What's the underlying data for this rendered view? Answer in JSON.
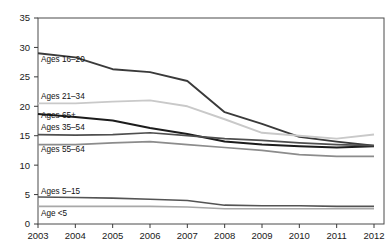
{
  "title_partial": "",
  "chart_data": {
    "type": "line",
    "title": "",
    "subtitle": "",
    "xlabel": "",
    "ylabel": "",
    "x": [
      "2003",
      "2004",
      "2005",
      "2006",
      "2007",
      "2008",
      "2009",
      "2010",
      "2011",
      "2012"
    ],
    "xlim": [
      2003,
      2012
    ],
    "ylim": [
      0,
      35
    ],
    "yticks": [
      "0",
      "5",
      "10",
      "15",
      "20",
      "25",
      "30",
      "35"
    ],
    "ytick_values": [
      0,
      5,
      10,
      15,
      20,
      25,
      30,
      35
    ],
    "grid": false,
    "legend": "inline-labels-left",
    "series": [
      {
        "name": "Ages 16–20",
        "label": "Ages 16–20",
        "color": "#3a3a3a",
        "width": 1.9,
        "label_x": 41,
        "label_y": 62,
        "values": [
          29.0,
          28.3,
          26.3,
          25.8,
          24.3,
          19.0,
          17.0,
          14.8,
          14.0,
          13.3
        ]
      },
      {
        "name": "Ages 21–34",
        "label": "Ages 21–34",
        "color": "#c9c9c9",
        "width": 1.9,
        "label_x": 41,
        "label_y": 99,
        "values": [
          20.5,
          20.5,
          20.8,
          21.0,
          20.0,
          17.8,
          15.5,
          15.0,
          14.5,
          15.2
        ]
      },
      {
        "name": "Ages 65+",
        "label": "Ages 65+",
        "color": "#1c1c1c",
        "width": 2.0,
        "label_x": 41,
        "label_y": 118,
        "values": [
          18.7,
          18.2,
          17.6,
          16.3,
          15.3,
          14.0,
          13.5,
          13.2,
          13.0,
          13.2
        ]
      },
      {
        "name": "Ages 35–54",
        "label": "Ages 35–54",
        "color": "#4f4f4f",
        "width": 1.7,
        "label_x": 41,
        "label_y": 130,
        "values": [
          15.2,
          15.1,
          15.2,
          15.5,
          15.0,
          14.5,
          14.2,
          13.8,
          13.5,
          13.3
        ]
      },
      {
        "name": "Ages 55–64",
        "label": "Ages 55–64",
        "color": "#8c8c8c",
        "width": 1.7,
        "label_x": 41,
        "label_y": 152,
        "values": [
          13.5,
          13.5,
          13.8,
          14.0,
          13.5,
          13.0,
          12.5,
          11.8,
          11.5,
          11.5
        ]
      },
      {
        "name": "Ages 5–15",
        "label": "Ages 5–15",
        "color": "#545454",
        "width": 1.6,
        "label_x": 41,
        "label_y": 194,
        "values": [
          4.6,
          4.5,
          4.4,
          4.2,
          4.0,
          3.2,
          3.1,
          3.1,
          3.0,
          3.0
        ]
      },
      {
        "name": "Age <5",
        "label": "Age <5",
        "color": "#a8a8a8",
        "width": 1.6,
        "label_x": 41,
        "label_y": 216,
        "values": [
          3.0,
          3.0,
          3.0,
          3.0,
          2.9,
          2.6,
          2.6,
          2.6,
          2.6,
          2.6
        ]
      }
    ]
  },
  "axes": {
    "y_axis_name": "y-axis",
    "x_axis_name": "x-axis"
  }
}
